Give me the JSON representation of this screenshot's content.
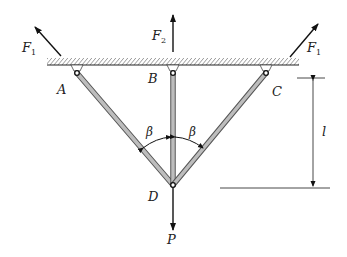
{
  "diagram": {
    "points": {
      "A": {
        "label": "A",
        "x": 77,
        "y": 73
      },
      "B": {
        "label": "B",
        "x": 173,
        "y": 73
      },
      "C": {
        "label": "C",
        "x": 266,
        "y": 73
      },
      "D": {
        "label": "D",
        "x": 173,
        "y": 185
      }
    },
    "forces": {
      "F1_left": {
        "label": "F",
        "sub": "1"
      },
      "F2": {
        "label": "F",
        "sub": "2"
      },
      "F1_right": {
        "label": "F",
        "sub": "1"
      },
      "P": {
        "label": "P"
      }
    },
    "angles": {
      "left": {
        "label": "β"
      },
      "right": {
        "label": "β"
      }
    },
    "dimension": {
      "label": "l"
    },
    "colors": {
      "bar_fill": "#b8b8b8",
      "bar_edge": "#555555",
      "line": "#111111",
      "hatch": "#333333"
    }
  }
}
